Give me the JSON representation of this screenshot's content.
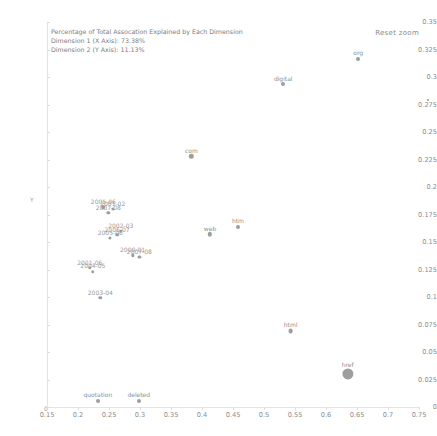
{
  "legend": {
    "title": "Percentage of Total Assocation Explained by Each Dimension",
    "line1": "Dimension 1 (X Axis): 73.38%",
    "line2": "Dimension 2 (Y Axis): 11.13%"
  },
  "controls": {
    "reset_zoom_label": "Reset zoom"
  },
  "axes": {
    "y_title": "Y",
    "x_title": "0",
    "y_ticks": [
      "0.35",
      "0.325",
      "0.3",
      "0.275",
      "0.25",
      "0.225",
      "0.2",
      "0.175",
      "0.15",
      "0.125",
      "0.1",
      "0.075",
      "0.05",
      "0.025",
      "0"
    ],
    "x_ticks": [
      "0.15",
      "0.2",
      "0.25",
      "0.3",
      "0.35",
      "0.4",
      "0.45",
      "0.5",
      "0.55",
      "0.6",
      "0.65",
      "0.7",
      "0.75"
    ]
  },
  "chart_data": {
    "type": "scatter",
    "title": "Percentage of Total Assocation Explained by Each Dimension",
    "xlabel": "Dimension 1 (X Axis): 73.38%",
    "ylabel": "Dimension 2 (Y Axis): 11.13%",
    "xlim": [
      0.15,
      0.75
    ],
    "ylim": [
      0,
      0.35
    ],
    "grid": false,
    "legend_position": "top-left",
    "dimension_1_pct": 73.38,
    "dimension_2_pct": 11.13,
    "series": [
      {
        "name": "years",
        "points": [
          {
            "label": "2005-06",
            "x": 0.241,
            "y": 0.1815,
            "r": 1.8
          },
          {
            "label": "2001-02",
            "x": 0.256,
            "y": 0.18,
            "r": 1.6
          },
          {
            "label": "2007-08",
            "x": 0.249,
            "y": 0.1765,
            "r": 1.7
          },
          {
            "label": "2002-03",
            "x": 0.269,
            "y": 0.16,
            "r": 1.6
          },
          {
            "label": "2006-07",
            "x": 0.263,
            "y": 0.1565,
            "r": 1.8
          },
          {
            "label": "2005-06",
            "x": 0.252,
            "y": 0.154,
            "r": 1.6
          },
          {
            "label": "2000-01",
            "x": 0.288,
            "y": 0.138,
            "r": 1.7
          },
          {
            "label": "2007-08",
            "x": 0.299,
            "y": 0.1365,
            "r": 1.6
          },
          {
            "label": "2001-06",
            "x": 0.219,
            "y": 0.1265,
            "r": 1.7
          },
          {
            "label": "2004-05",
            "x": 0.224,
            "y": 0.123,
            "r": 1.8
          },
          {
            "label": "2003-04",
            "x": 0.236,
            "y": 0.099,
            "r": 1.7
          }
        ]
      },
      {
        "name": "terms",
        "points": [
          {
            "label": "org",
            "x": 0.652,
            "y": 0.3165,
            "r": 2.0
          },
          {
            "label": "digital",
            "x": 0.531,
            "y": 0.2935,
            "r": 2.0
          },
          {
            "label": "com",
            "x": 0.383,
            "y": 0.228,
            "r": 2.2
          },
          {
            "label": "web",
            "x": 0.413,
            "y": 0.157,
            "r": 2.2
          },
          {
            "label": "htm",
            "x": 0.458,
            "y": 0.164,
            "r": 2.0
          },
          {
            "label": "html",
            "x": 0.543,
            "y": 0.069,
            "r": 2.4
          },
          {
            "label": "href",
            "x": 0.635,
            "y": 0.03,
            "r": 5.6
          },
          {
            "label": "quotation",
            "x": 0.232,
            "y": 0.0055,
            "r": 2.0
          },
          {
            "label": "deleted",
            "x": 0.298,
            "y": 0.0055,
            "r": 2.0
          }
        ]
      }
    ]
  }
}
